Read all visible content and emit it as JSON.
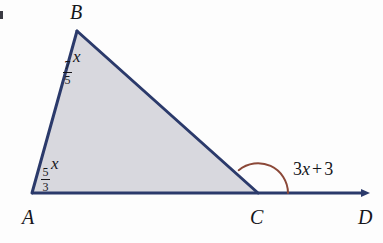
{
  "figure": {
    "type": "geometry-diagram",
    "background_color": "#fdfdfd",
    "triangle": {
      "fill_color": "#d8d8de",
      "stroke_color": "#2b3a6b",
      "stroke_width": 3,
      "vertices": [
        {
          "name": "A",
          "x": 32,
          "y": 193
        },
        {
          "name": "B",
          "x": 77,
          "y": 31
        },
        {
          "name": "C",
          "x": 258,
          "y": 193
        }
      ]
    },
    "ray": {
      "from": "A",
      "through": "C",
      "to": "D",
      "end_x": 370,
      "end_y": 193,
      "color": "#2b3a6b",
      "has_arrowhead": true
    },
    "arc": {
      "at_vertex": "C",
      "color": "#8b4838",
      "stroke_width": 2,
      "radius": 30,
      "marks": "exterior-angle"
    }
  },
  "vertex_labels": {
    "a": "A",
    "b": "B",
    "c": "C",
    "d": "D"
  },
  "angles": {
    "at_b": {
      "numerator": "7",
      "denominator": "5",
      "variable": "x"
    },
    "at_a": {
      "numerator": "5",
      "denominator": "3",
      "variable": "x"
    },
    "exterior_at_c": {
      "coefficient": "3",
      "variable": "x",
      "operator": "+",
      "constant": "3",
      "full_text": "3x + 3"
    }
  }
}
